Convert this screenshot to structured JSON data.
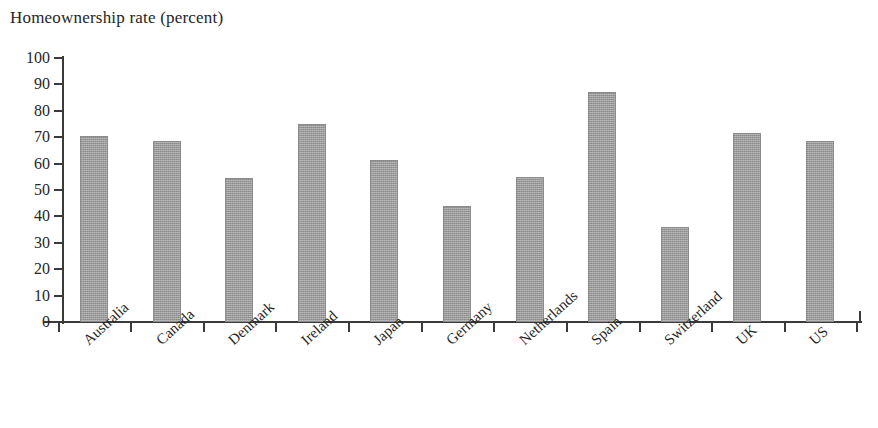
{
  "chart": {
    "title": "Homeownership rate (percent)"
  },
  "chart_data": {
    "type": "bar",
    "title": "Homeownership rate (percent)",
    "xlabel": "",
    "ylabel": "Homeownership rate (percent)",
    "ylim": [
      0,
      100
    ],
    "yticks": [
      0,
      10,
      20,
      30,
      40,
      50,
      60,
      70,
      80,
      90,
      100
    ],
    "ytick_labels": [
      "0",
      "10",
      "20",
      "30",
      "40",
      "50",
      "60",
      "70",
      "80",
      "90",
      "100"
    ],
    "grid": false,
    "legend": null,
    "bar_color": "#9a9a9a",
    "categories": [
      "Australia",
      "Canada",
      "Denmark",
      "Ireland",
      "Japan",
      "Germany",
      "Netherlands",
      "Spain",
      "Switzerland",
      "UK",
      "US"
    ],
    "values": [
      70.5,
      68.5,
      54.5,
      75,
      61.5,
      44,
      55,
      87,
      36,
      71.5,
      68.5
    ],
    "series": [
      {
        "name": "Homeownership rate",
        "values": [
          70.5,
          68.5,
          54.5,
          75,
          61.5,
          44,
          55,
          87,
          36,
          71.5,
          68.5
        ]
      }
    ]
  }
}
